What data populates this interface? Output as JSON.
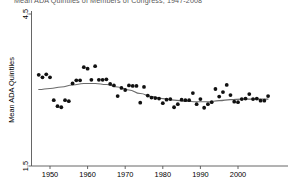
{
  "figure": {
    "title_partial": "Mean ADA Quintiles of Members of Congress, 1947-2008",
    "y_axis_label": "Mean ADA Quintiles",
    "x_axis_label": ""
  },
  "chart_data": {
    "type": "scatter",
    "title": "Mean ADA Quintiles of Members of Congress, 1947-2008",
    "xlabel": "",
    "ylabel": "Mean ADA Quintiles",
    "xlim": [
      1946,
      2009
    ],
    "ylim": [
      1.5,
      4.5
    ],
    "grid": false,
    "legend": "none",
    "xticks": [
      1950,
      1960,
      1970,
      1980,
      1990,
      2000
    ],
    "xtick_labels": [
      "1950",
      "1960",
      "1970",
      "1980",
      "1990",
      "2000"
    ],
    "yticks": [
      1.5,
      4.5
    ],
    "ytick_labels": [
      "1.5",
      "4.5"
    ],
    "marker": "filled-circle",
    "marker_color": "#111111",
    "trend_color": "#6b6b6b",
    "series": [
      {
        "name": "Mean ADA Quintiles",
        "x": [
          1947,
          1948,
          1949,
          1950,
          1951,
          1952,
          1953,
          1954,
          1955,
          1956,
          1957,
          1958,
          1959,
          1960,
          1961,
          1962,
          1963,
          1964,
          1965,
          1966,
          1967,
          1968,
          1969,
          1970,
          1971,
          1972,
          1973,
          1974,
          1975,
          1976,
          1977,
          1978,
          1979,
          1980,
          1981,
          1982,
          1983,
          1984,
          1985,
          1986,
          1987,
          1988,
          1989,
          1990,
          1991,
          1992,
          1993,
          1994,
          1995,
          1996,
          1997,
          1998,
          1999,
          2000,
          2001,
          2002,
          2003,
          2004,
          2005,
          2006,
          2007,
          2008
        ],
        "y": [
          3.3,
          3.25,
          3.31,
          3.25,
          2.8,
          2.68,
          2.66,
          2.8,
          2.78,
          3.13,
          3.19,
          3.19,
          3.45,
          3.42,
          3.2,
          3.47,
          3.2,
          3.2,
          3.21,
          3.12,
          3.09,
          2.88,
          3.04,
          3.0,
          3.09,
          3.08,
          3.08,
          2.75,
          3.06,
          2.89,
          2.85,
          2.84,
          2.83,
          2.74,
          2.81,
          2.82,
          2.66,
          2.72,
          2.81,
          2.8,
          2.8,
          2.94,
          2.72,
          2.82,
          2.65,
          2.72,
          2.76,
          3.02,
          2.87,
          2.96,
          3.1,
          2.9,
          2.77,
          2.76,
          2.82,
          2.83,
          2.92,
          2.82,
          2.83,
          2.79,
          2.79,
          2.88
        ],
        "trend_x": [
          1947,
          1950,
          1953,
          1956,
          1959,
          1962,
          1965,
          1968,
          1971,
          1974,
          1977,
          1980,
          1983,
          1986,
          1989,
          1992,
          1995,
          1998,
          2001,
          2004,
          2008
        ],
        "trend_y": [
          3.01,
          3.03,
          3.06,
          3.1,
          3.13,
          3.13,
          3.11,
          3.06,
          3.0,
          2.93,
          2.87,
          2.83,
          2.8,
          2.78,
          2.77,
          2.77,
          2.79,
          2.81,
          2.82,
          2.82,
          2.82
        ]
      }
    ]
  }
}
